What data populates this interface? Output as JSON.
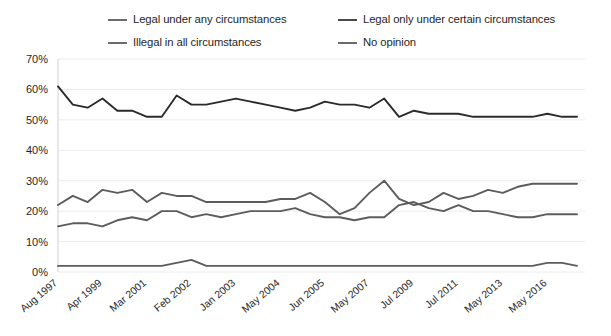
{
  "chart_data": {
    "type": "line",
    "title": "",
    "subtitle": "",
    "xlabel": "",
    "ylabel": "",
    "ylim": [
      0,
      70
    ],
    "ytick_labels": [
      "0%",
      "10%",
      "20%",
      "30%",
      "40%",
      "50%",
      "60%",
      "70%"
    ],
    "ytick_values": [
      0,
      10,
      20,
      30,
      40,
      50,
      60,
      70
    ],
    "grid": true,
    "legend_position": "top",
    "x_tick_labels": [
      "Aug 1997",
      "Apr 1999",
      "Mar 2001",
      "Feb 2002",
      "Jan 2003",
      "May 2004",
      "Jun 2005",
      "May 2007",
      "Jul 2009",
      "Jul 2011",
      "May 2013",
      "May 2016"
    ],
    "x_tick_indices": [
      0,
      3,
      6,
      9,
      12,
      15,
      18,
      21,
      24,
      27,
      30,
      33
    ],
    "x": [
      0,
      1,
      2,
      3,
      4,
      5,
      6,
      7,
      8,
      9,
      10,
      11,
      12,
      13,
      14,
      15,
      16,
      17,
      18,
      19,
      20,
      21,
      22,
      23,
      24,
      25,
      26,
      27,
      28,
      29,
      30,
      31,
      32,
      33,
      34,
      35
    ],
    "series": [
      {
        "name": "Legal only under certain circumstances",
        "color": "#2b2b2b",
        "values": [
          61,
          55,
          54,
          57,
          53,
          53,
          51,
          51,
          58,
          55,
          55,
          56,
          57,
          56,
          55,
          54,
          53,
          54,
          56,
          55,
          55,
          54,
          57,
          51,
          53,
          52,
          52,
          52,
          51,
          51,
          51,
          51,
          51,
          52,
          51,
          51
        ]
      },
      {
        "name": "Legal under any circumstances",
        "color": "#5c5c5c",
        "values": [
          22,
          25,
          23,
          27,
          26,
          27,
          23,
          26,
          25,
          25,
          23,
          23,
          23,
          23,
          23,
          24,
          24,
          26,
          23,
          19,
          21,
          26,
          30,
          24,
          22,
          23,
          26,
          24,
          25,
          27,
          26,
          28,
          29,
          29,
          29,
          29
        ]
      },
      {
        "name": "Illegal in all circumstances",
        "color": "#5c5c5c",
        "values": [
          15,
          16,
          16,
          15,
          17,
          18,
          17,
          20,
          20,
          18,
          19,
          18,
          19,
          20,
          20,
          20,
          21,
          19,
          18,
          18,
          17,
          18,
          18,
          22,
          23,
          21,
          20,
          22,
          20,
          20,
          19,
          18,
          18,
          19,
          19,
          19
        ]
      },
      {
        "name": "No opinion",
        "color": "#5c5c5c",
        "values": [
          2,
          2,
          2,
          2,
          2,
          2,
          2,
          2,
          3,
          4,
          2,
          2,
          2,
          2,
          2,
          2,
          2,
          2,
          2,
          2,
          2,
          2,
          2,
          2,
          2,
          2,
          2,
          2,
          2,
          2,
          2,
          2,
          2,
          3,
          3,
          2
        ]
      }
    ]
  },
  "legend": {
    "items": [
      {
        "label": "Legal under any circumstances",
        "swatch_color": "#6b6b6b"
      },
      {
        "label": "Legal only under certain circumstances",
        "swatch_color": "#4a4a4a"
      },
      {
        "label": "Illegal in all circumstances",
        "swatch_color": "#6b6b6b"
      },
      {
        "label": "No opinion",
        "swatch_color": "#6b6b6b"
      }
    ]
  }
}
